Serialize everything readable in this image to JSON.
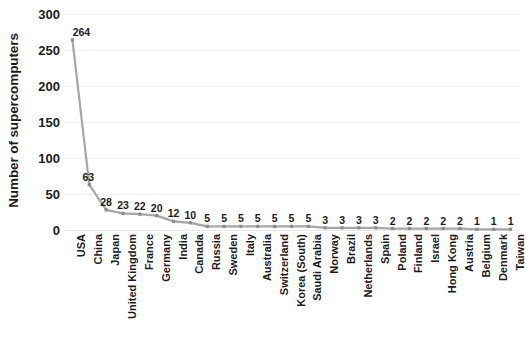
{
  "chart_data": {
    "type": "line",
    "title": "",
    "xlabel": "",
    "ylabel": "Number of supercomputers",
    "ylim": [
      0,
      300
    ],
    "ytick_step": 50,
    "yticks": [
      300,
      250,
      200,
      150,
      100,
      50,
      0
    ],
    "grid": true,
    "legend": "none",
    "marker": "small-square",
    "line_color": "#a6a6a6",
    "label_color": "#1b1b1b",
    "data_labels_shown": true,
    "categories": [
      "USA",
      "China",
      "Japan",
      "United Kingdom",
      "France",
      "Germany",
      "India",
      "Canada",
      "Russia",
      "Sweden",
      "Italy",
      "Australia",
      "Switzerland",
      "Korea (South)",
      "Saudi Arabia",
      "Norway",
      "Brazil",
      "Netherlands",
      "Spain",
      "Poland",
      "Finland",
      "Israel",
      "Hong Kong",
      "Austria",
      "Belgium",
      "Denmark",
      "Taiwan"
    ],
    "values": [
      264,
      63,
      28,
      23,
      22,
      20,
      12,
      10,
      5,
      5,
      5,
      5,
      5,
      5,
      5,
      3,
      3,
      3,
      3,
      2,
      2,
      2,
      2,
      2,
      1,
      1,
      1
    ]
  }
}
